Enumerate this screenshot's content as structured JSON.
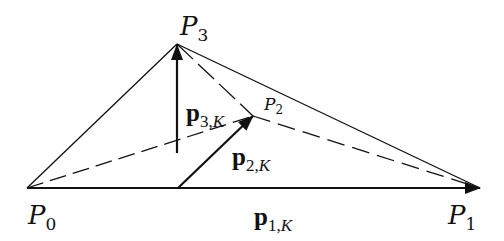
{
  "diagram": {
    "points": {
      "P0": {
        "label": "P",
        "sub": "0",
        "x": 27,
        "y": 188
      },
      "P1": {
        "label": "P",
        "sub": "1",
        "x": 480,
        "y": 188
      },
      "P2": {
        "label": "P",
        "sub": "2",
        "x": 253,
        "y": 116
      },
      "P3": {
        "label": "P",
        "sub": "3",
        "x": 177,
        "y": 44
      }
    },
    "vectors": {
      "p1K": {
        "label": "p",
        "sub_num": "1,",
        "sub_var": "K"
      },
      "p2K": {
        "label": "p",
        "sub_num": "2,",
        "sub_var": "K"
      },
      "p3K": {
        "label": "p",
        "sub_num": "3,",
        "sub_var": "K"
      }
    },
    "colors": {
      "stroke": "#111111",
      "background": "#ffffff"
    }
  }
}
